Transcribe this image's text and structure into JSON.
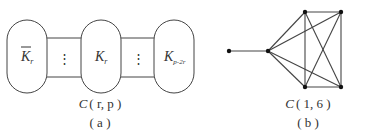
{
  "figure_a": {
    "nodes": [
      {
        "base": "K",
        "sub": "r",
        "overline": true
      },
      {
        "base": "K",
        "sub": "r",
        "overline": false
      },
      {
        "base": "K",
        "sub": "p-2r",
        "overline": false
      }
    ],
    "connector_symbol": "⋮",
    "caption_italic": "C",
    "caption_args": "( r, p )",
    "panel_label": "( a )"
  },
  "figure_b": {
    "caption_italic": "C",
    "caption_args": "( 1, 6 )",
    "panel_label": "( b )",
    "vertices": [
      {
        "id": "v1",
        "x": 229,
        "y": 51
      },
      {
        "id": "v2",
        "x": 268,
        "y": 51
      },
      {
        "id": "v3",
        "x": 305,
        "y": 12
      },
      {
        "id": "v4",
        "x": 341,
        "y": 12
      },
      {
        "id": "v5",
        "x": 305,
        "y": 87
      },
      {
        "id": "v6",
        "x": 341,
        "y": 87
      }
    ],
    "edges": [
      [
        "v1",
        "v2"
      ],
      [
        "v2",
        "v3"
      ],
      [
        "v2",
        "v4"
      ],
      [
        "v2",
        "v5"
      ],
      [
        "v2",
        "v6"
      ],
      [
        "v3",
        "v4"
      ],
      [
        "v3",
        "v5"
      ],
      [
        "v3",
        "v6"
      ],
      [
        "v4",
        "v5"
      ],
      [
        "v4",
        "v6"
      ],
      [
        "v5",
        "v6"
      ]
    ]
  },
  "colors": {
    "stroke": "#444444",
    "text": "#333333",
    "background": "#ffffff"
  }
}
